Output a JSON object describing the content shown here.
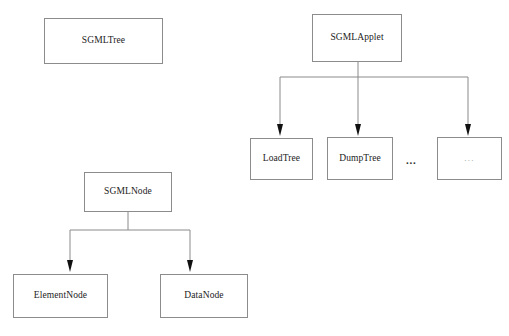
{
  "diagram": {
    "type": "class-hierarchy-diagram",
    "background_color": "#ffffff",
    "box_border_color": "#8c8c8c",
    "edge_color": "#808080",
    "arrow_color": "#000000",
    "nodes": [
      {
        "id": "sgmltree",
        "label": "SGMLTree",
        "x": 44,
        "y": 18,
        "w": 119,
        "h": 46,
        "faint": false
      },
      {
        "id": "sgmlapplet",
        "label": "SGMLApplet",
        "x": 312,
        "y": 14,
        "w": 90,
        "h": 48,
        "faint": false
      },
      {
        "id": "loadtree",
        "label": "LoadTree",
        "x": 250,
        "y": 138,
        "w": 63,
        "h": 42,
        "faint": false
      },
      {
        "id": "dumptree",
        "label": "DumpTree",
        "x": 327,
        "y": 137,
        "w": 66,
        "h": 43,
        "faint": false
      },
      {
        "id": "applet-more",
        "label": "...",
        "x": 437,
        "y": 137,
        "w": 65,
        "h": 43,
        "faint": true
      },
      {
        "id": "sgmlnode",
        "label": "SGMLNode",
        "x": 84,
        "y": 172,
        "w": 88,
        "h": 40,
        "faint": false
      },
      {
        "id": "elementnode",
        "label": "ElementNode",
        "x": 13,
        "y": 274,
        "w": 95,
        "h": 44,
        "faint": false
      },
      {
        "id": "datanode",
        "label": "DataNode",
        "x": 160,
        "y": 274,
        "w": 88,
        "h": 44,
        "faint": false
      }
    ],
    "ellipsis_marker": {
      "label": "...",
      "x": 406,
      "y": 155
    },
    "edges": [
      {
        "from": "sgmlapplet",
        "to": "loadtree",
        "stem_x": 358,
        "bar_y": 77,
        "child_x": 280,
        "tip_y": 136
      },
      {
        "from": "sgmlapplet",
        "to": "dumptree",
        "stem_x": 358,
        "bar_y": 77,
        "child_x": 358,
        "tip_y": 136
      },
      {
        "from": "sgmlapplet",
        "to": "applet-more",
        "stem_x": 358,
        "bar_y": 77,
        "child_x": 468,
        "tip_y": 136
      },
      {
        "from": "sgmlnode",
        "to": "elementnode",
        "stem_x": 128,
        "bar_y": 230,
        "child_x": 70,
        "tip_y": 272
      },
      {
        "from": "sgmlnode",
        "to": "datanode",
        "stem_x": 128,
        "bar_y": 230,
        "child_x": 190,
        "tip_y": 272
      }
    ]
  }
}
